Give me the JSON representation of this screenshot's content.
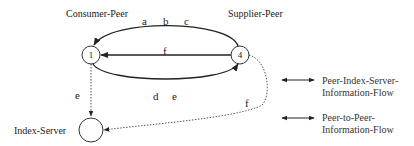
{
  "diagram": {
    "nodes": [
      {
        "id": "1",
        "label": "1",
        "caption": "Consumer-Peer"
      },
      {
        "id": "4",
        "label": "4",
        "caption": "Supplier-Peer"
      },
      {
        "id": "index",
        "label": "",
        "caption": "Index-Server"
      }
    ],
    "edges": {
      "top_arc": {
        "from": "4",
        "to": "1",
        "labels": [
          "a",
          "b",
          "c"
        ],
        "style": "solid"
      },
      "middle": {
        "from": "4",
        "to": "1",
        "label": "f",
        "style": "solid"
      },
      "bottom_arc": {
        "from": "1",
        "to": "4",
        "labels": [
          "d",
          "e"
        ],
        "style": "solid"
      },
      "peer_to_index": {
        "from": "1",
        "to": "index",
        "label": "e",
        "style": "dotted"
      },
      "supplier_to_index": {
        "from": "4",
        "to": "index",
        "label": "f",
        "style": "dotted"
      }
    },
    "edge_labels": {
      "a": "a",
      "b": "b",
      "c": "c",
      "f_mid": "f",
      "d": "d",
      "e_bottom": "e",
      "e_left": "e",
      "f_right": "f"
    }
  },
  "legend": {
    "items": [
      {
        "line1": "Peer-Index-Server-",
        "line2": "Information-Flow",
        "style": "dotted"
      },
      {
        "line1": "Peer-to-Peer-",
        "line2": "Information-Flow",
        "style": "solid"
      }
    ]
  },
  "colors": {
    "line": "#222222",
    "dotted": "#555555",
    "background": "#ffffff"
  }
}
